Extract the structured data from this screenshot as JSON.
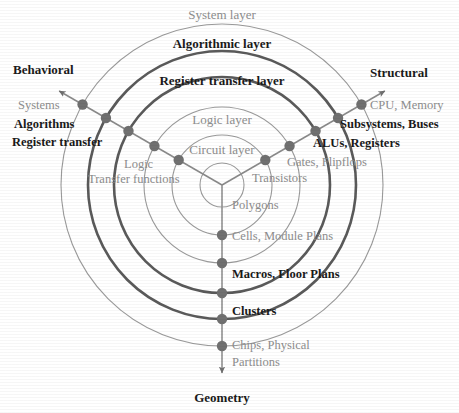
{
  "chart_data": {
    "type": "diagram",
    "title": "Gajski-Kuhn Y-Chart",
    "geometry": {
      "center_x": 222,
      "center_y": 185,
      "axis_angles_deg": {
        "behavioral": 150,
        "structural": 30,
        "geometry": 270
      }
    },
    "colors": {
      "bold_text": "#1a1a1a",
      "gray_text": "#8d8d8d",
      "dot": "#707070",
      "thin_ring": "#9a9a9a",
      "thick_ring": "#5a5a5a",
      "axis_line": "#8a8a8a"
    },
    "rings": [
      {
        "name": "System layer",
        "radius": 161,
        "emphasis": "thin",
        "label": "System layer"
      },
      {
        "name": "Algorithmic layer",
        "radius": 134,
        "emphasis": "thick",
        "label": "Algorithmic layer"
      },
      {
        "name": "Register transfer layer",
        "radius": 108,
        "emphasis": "thick",
        "label": "Register transfer layer"
      },
      {
        "name": "Logic layer",
        "radius": 78,
        "emphasis": "thin",
        "label": "Logic layer"
      },
      {
        "name": "Circuit layer",
        "radius": 50,
        "emphasis": "thin",
        "label": "Circuit layer"
      },
      {
        "name": "Innermost",
        "radius": 22,
        "emphasis": "thin",
        "label": ""
      }
    ],
    "axes": [
      {
        "id": "behavioral",
        "title": "Behavioral",
        "title_emphasis": "bold",
        "points": [
          {
            "label": "Systems",
            "radius": 161,
            "emphasis": "gray"
          },
          {
            "label": "Algorithms",
            "radius": 134,
            "emphasis": "bold"
          },
          {
            "label": "Register transfer",
            "radius": 108,
            "emphasis": "bold"
          },
          {
            "label": "Logic",
            "radius": 78,
            "emphasis": "gray"
          },
          {
            "label": "Transfer functions",
            "radius": 50,
            "emphasis": "gray"
          }
        ]
      },
      {
        "id": "structural",
        "title": "Structural",
        "title_emphasis": "bold",
        "points": [
          {
            "label": "CPU, Memory",
            "radius": 161,
            "emphasis": "gray"
          },
          {
            "label": "Subsystems, Buses",
            "radius": 134,
            "emphasis": "bold"
          },
          {
            "label": "ALUs, Registers",
            "radius": 108,
            "emphasis": "bold"
          },
          {
            "label": "Gates, Flipflops",
            "radius": 78,
            "emphasis": "gray"
          },
          {
            "label": "Transistors",
            "radius": 50,
            "emphasis": "gray"
          }
        ]
      },
      {
        "id": "geometry",
        "title": "Geometry",
        "title_emphasis": "bold",
        "points": [
          {
            "label": "Chips, Physical Partitions",
            "radius": 161,
            "emphasis": "gray"
          },
          {
            "label": "Clusters",
            "radius": 134,
            "emphasis": "bold"
          },
          {
            "label": "Macros, Floor Plans",
            "radius": 108,
            "emphasis": "bold"
          },
          {
            "label": "Cells, Module Plans",
            "radius": 78,
            "emphasis": "gray"
          },
          {
            "label": "Polygons",
            "radius": 50,
            "emphasis": "gray"
          }
        ]
      }
    ]
  },
  "labels": {
    "ring_system": "System layer",
    "ring_algorithmic": "Algorithmic layer",
    "ring_register_transfer": "Register transfer layer",
    "ring_logic": "Logic layer",
    "ring_circuit": "Circuit layer",
    "axis_behavioral": "Behavioral",
    "axis_structural": "Structural",
    "axis_geometry": "Geometry",
    "beh_systems": "Systems",
    "beh_algorithms": "Algorithms",
    "beh_register_transfer": "Register transfer",
    "beh_logic": "Logic",
    "beh_transfer_functions": "Transfer functions",
    "str_cpu_memory": "CPU, Memory",
    "str_subsystems_buses": "Subsystems, Buses",
    "str_alus_registers": "ALUs, Registers",
    "str_gates_flipflops": "Gates, Flipflops",
    "str_transistors": "Transistors",
    "geo_chips_1": "Chips, Physical",
    "geo_chips_2": "Partitions",
    "geo_clusters": "Clusters",
    "geo_macros_floor_plans": "Macros, Floor Plans",
    "geo_cells_module_plans": "Cells, Module Plans",
    "geo_polygons": "Polygons"
  }
}
